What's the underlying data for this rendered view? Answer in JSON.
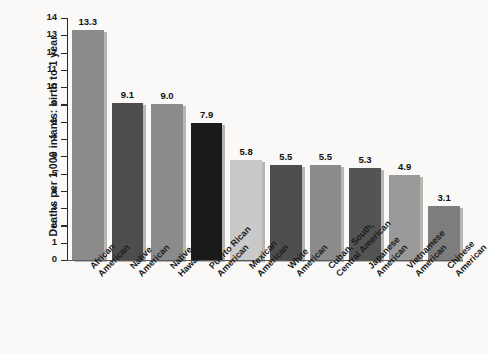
{
  "chart_data": {
    "type": "bar",
    "title": "",
    "xlabel": "",
    "ylabel": "Deaths per 1,000 infants: birth to 1 year",
    "ylim": [
      0,
      14
    ],
    "ytick_step": 1,
    "yticks": [
      "14",
      "13",
      "12",
      "11",
      "10",
      "9",
      "8",
      "7",
      "6",
      "5",
      "4",
      "3",
      "2",
      "1",
      "0"
    ],
    "grid": false,
    "legend": "none",
    "categories": [
      "African American",
      "Native American",
      "Native Hawaiian",
      "Puerto Rican American",
      "Mexican American",
      "White American",
      "Cuban, South, Central American",
      "Japanese American",
      "Vietnamese American",
      "Chinese American"
    ],
    "values": [
      13.3,
      9.1,
      9.0,
      7.9,
      5.8,
      5.5,
      5.5,
      5.3,
      4.9,
      3.1
    ],
    "value_labels": [
      "13.3",
      "9.1",
      "9.0",
      "7.9",
      "5.8",
      "5.5",
      "5.5",
      "5.3",
      "4.9",
      "3.1"
    ],
    "bars": [
      {
        "label": "African American",
        "label_lines": [
          "African",
          "American"
        ],
        "value": 13.3,
        "value_label": "13.3",
        "color": "#8b8b8b"
      },
      {
        "label": "Native American",
        "label_lines": [
          "Native",
          "American"
        ],
        "value": 9.1,
        "value_label": "9.1",
        "color": "#4d4d4d"
      },
      {
        "label": "Native Hawaiian",
        "label_lines": [
          "Native",
          "Hawaiian"
        ],
        "value": 9.0,
        "value_label": "9.0",
        "color": "#8b8b8b"
      },
      {
        "label": "Puerto Rican American",
        "label_lines": [
          "Puerto Rican",
          "American"
        ],
        "value": 7.9,
        "value_label": "7.9",
        "color": "#1a1a1a"
      },
      {
        "label": "Mexican American",
        "label_lines": [
          "Mexican",
          "American"
        ],
        "value": 5.8,
        "value_label": "5.8",
        "color": "#c9c9c9"
      },
      {
        "label": "White American",
        "label_lines": [
          "White",
          "American"
        ],
        "value": 5.5,
        "value_label": "5.5",
        "color": "#4d4d4d"
      },
      {
        "label": "Cuban, South, Central American",
        "label_lines": [
          "Cuban, South,",
          "Central American"
        ],
        "value": 5.5,
        "value_label": "5.5",
        "color": "#8b8b8b"
      },
      {
        "label": "Japanese American",
        "label_lines": [
          "Japanese",
          "American"
        ],
        "value": 5.3,
        "value_label": "5.3",
        "color": "#545454"
      },
      {
        "label": "Vietnamese American",
        "label_lines": [
          "Vietnamese",
          "American"
        ],
        "value": 4.9,
        "value_label": "4.9",
        "color": "#9a9a9a"
      },
      {
        "label": "Chinese American",
        "label_lines": [
          "Chinese",
          "American"
        ],
        "value": 3.1,
        "value_label": "3.1",
        "color": "#7d7d7d"
      }
    ],
    "colors": {
      "background": "#faf9f7",
      "axis": "#2a2a2a",
      "text": "#1b1b1b",
      "bar_shadow": "#b9b6b2"
    }
  }
}
